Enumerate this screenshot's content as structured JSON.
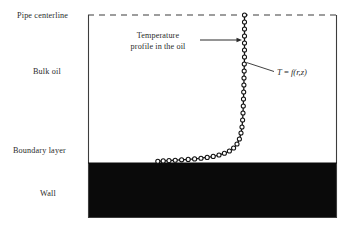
{
  "figure": {
    "labels": {
      "pipe_centerline": "Pipe centerline",
      "bulk_oil": "Bulk oil",
      "boundary_layer": "Boundary layer",
      "wall": "Wall"
    },
    "annotations": {
      "profile_line1": "Temperature",
      "profile_line2": "profile in the oil",
      "equation_lhs": "T",
      "equation_eq": " = ",
      "equation_rhs": "f(r,z)"
    },
    "colors": {
      "wall_fill": "#0a0a0a",
      "oil_fill": "#ffffff",
      "border": "#3d3d3d",
      "curve": "#111111",
      "marker_fill": "#ffffff",
      "text": "#2b2b2b"
    }
  },
  "chart_data": {
    "type": "line",
    "title": "Temperature profile in the oil",
    "xlabel": "",
    "ylabel": "",
    "axis_notes": {
      "vertical_axis": "radial position r (wall at bottom, pipe centerline at top)",
      "horizontal_axis": "temperature T"
    },
    "regions": [
      {
        "name": "Bulk oil",
        "y_top_px": 15,
        "y_bottom_px": 163,
        "fill": "#ffffff"
      },
      {
        "name": "Boundary layer",
        "y_top_px": 140,
        "y_bottom_px": 163,
        "fill": "#ffffff"
      },
      {
        "name": "Wall",
        "y_top_px": 163,
        "y_bottom_px": 218,
        "fill": "#0a0a0a"
      }
    ],
    "plot_box_px": {
      "left": 88,
      "right": 337,
      "top": 15,
      "bottom": 218
    },
    "centerline_y_px": 15,
    "wall_surface_y_px": 163,
    "series": [
      {
        "name": "T = f(r,z)",
        "marker": "open-circle",
        "points_px": [
          [
            244.5,
            15
          ],
          [
            244.5,
            22
          ],
          [
            244.5,
            29
          ],
          [
            244.5,
            36
          ],
          [
            244.5,
            43
          ],
          [
            244.5,
            50
          ],
          [
            244.5,
            57
          ],
          [
            244.3,
            64
          ],
          [
            244.2,
            71
          ],
          [
            244.0,
            78
          ],
          [
            243.9,
            85
          ],
          [
            243.7,
            92
          ],
          [
            243.5,
            99
          ],
          [
            243.3,
            106
          ],
          [
            243.0,
            113
          ],
          [
            242.6,
            120
          ],
          [
            242.0,
            127
          ],
          [
            241.0,
            133
          ],
          [
            239.4,
            139
          ],
          [
            237.0,
            144
          ],
          [
            233.6,
            148
          ],
          [
            229.4,
            151
          ],
          [
            224.4,
            153.2
          ],
          [
            219.0,
            155.0
          ],
          [
            213.2,
            156.4
          ],
          [
            207.2,
            157.4
          ],
          [
            201.0,
            158.2
          ],
          [
            194.6,
            158.9
          ],
          [
            188.2,
            159.4
          ],
          [
            181.6,
            159.8
          ],
          [
            175.2,
            160.2
          ],
          [
            169.0,
            160.6
          ],
          [
            163.2,
            160.9
          ],
          [
            157.8,
            161.2
          ]
        ]
      }
    ],
    "centerline_marker_px": [
      244.5,
      15
    ],
    "annotations": [
      {
        "text": "Temperature profile in the oil",
        "text_anchor_px": [
          165,
          41
        ],
        "arrow_from_px": [
          200,
          40
        ],
        "arrow_to_px": [
          241,
          40
        ]
      },
      {
        "text": "T = f(r,z)",
        "text_anchor_px": [
          278,
          73
        ],
        "leader_from_px": [
          275,
          71
        ],
        "leader_to_px": [
          246,
          63
        ]
      }
    ]
  }
}
